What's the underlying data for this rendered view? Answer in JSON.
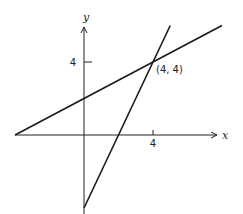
{
  "chart_data": {
    "type": "line",
    "title": "",
    "xlabel": "x",
    "ylabel": "y",
    "xlim": [
      -4,
      8
    ],
    "ylim": [
      -4,
      6
    ],
    "x_ticks": [
      4
    ],
    "y_ticks": [
      4
    ],
    "x_tick_labels": [
      "4"
    ],
    "y_tick_labels": [
      "4"
    ],
    "grid": false,
    "series": [
      {
        "name": "y = x/2 + 2",
        "points": [
          [
            -4,
            0
          ],
          [
            8,
            6
          ]
        ]
      },
      {
        "name": "y = 2x - 4",
        "points": [
          [
            0,
            -4
          ],
          [
            5,
            6
          ]
        ]
      }
    ],
    "annotations": [
      {
        "text": "(4, 4)",
        "x": 4,
        "y": 4
      }
    ]
  }
}
